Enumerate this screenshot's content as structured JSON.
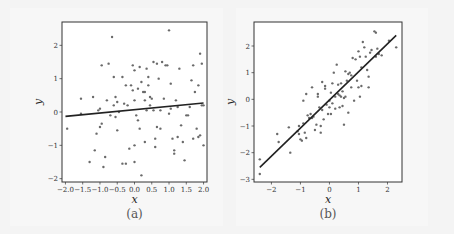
{
  "chart_data": [
    {
      "type": "scatter",
      "caption": "(a)",
      "xlabel": "x",
      "ylabel": "y",
      "xlim": [
        -2.1,
        2.1
      ],
      "ylim": [
        -2.1,
        2.7
      ],
      "xticks": [
        "-2.0",
        "-1.5",
        "-1.0",
        "-0.5",
        "0.0",
        "0.5",
        "1.0",
        "1.5",
        "2.0"
      ],
      "xtick_values": [
        -2.0,
        -1.5,
        -1.0,
        -0.5,
        0.0,
        0.5,
        1.0,
        1.5,
        2.0
      ],
      "yticks": [
        "-2",
        "-1",
        "0",
        "1",
        "2"
      ],
      "ytick_values": [
        -2,
        -1,
        0,
        1,
        2
      ],
      "grid": false,
      "fit_line": {
        "x": [
          -2.0,
          2.0
        ],
        "y": [
          -0.13,
          0.27
        ]
      },
      "points": [
        [
          -1.95,
          -0.5
        ],
        [
          -1.55,
          0.4
        ],
        [
          -1.55,
          -0.05
        ],
        [
          -1.2,
          0.45
        ],
        [
          -1.15,
          -1.15
        ],
        [
          -1.1,
          -0.65
        ],
        [
          -1.05,
          0.05
        ],
        [
          -1.0,
          0.1
        ],
        [
          -0.95,
          1.4
        ],
        [
          -1.0,
          -0.45
        ],
        [
          -0.95,
          -0.35
        ],
        [
          -0.9,
          -1.65
        ],
        [
          -0.85,
          -1.35
        ],
        [
          -0.75,
          1.45
        ],
        [
          -0.7,
          -0.1
        ],
        [
          -0.65,
          2.25
        ],
        [
          -0.6,
          1.05
        ],
        [
          -0.55,
          0.45
        ],
        [
          -0.55,
          -0.15
        ],
        [
          -0.5,
          0.3
        ],
        [
          -0.5,
          -0.55
        ],
        [
          -0.45,
          0.0
        ],
        [
          -0.35,
          1.05
        ],
        [
          -0.35,
          -1.55
        ],
        [
          -0.3,
          0.25
        ],
        [
          -0.25,
          -1.55
        ],
        [
          -0.2,
          0.2
        ],
        [
          -0.15,
          -1.1
        ],
        [
          -0.1,
          0.8
        ],
        [
          -0.05,
          0.65
        ],
        [
          -0.05,
          1.4
        ],
        [
          0.0,
          1.25
        ],
        [
          0.0,
          0.35
        ],
        [
          0.0,
          -1.0
        ],
        [
          0.0,
          -1.5
        ],
        [
          0.05,
          -0.1
        ],
        [
          0.1,
          0.7
        ],
        [
          0.1,
          -0.25
        ],
        [
          0.15,
          -0.5
        ],
        [
          0.2,
          0.9
        ],
        [
          0.2,
          -1.9
        ],
        [
          0.25,
          0.6
        ],
        [
          0.3,
          0.35
        ],
        [
          0.3,
          0.6
        ],
        [
          0.3,
          -0.9
        ],
        [
          0.35,
          1.3
        ],
        [
          0.35,
          0.05
        ],
        [
          0.4,
          1.05
        ],
        [
          0.4,
          0.8
        ],
        [
          0.45,
          0.45
        ],
        [
          0.5,
          0.4
        ],
        [
          0.55,
          1.5
        ],
        [
          0.55,
          0.05
        ],
        [
          0.6,
          -0.8
        ],
        [
          0.6,
          -1.05
        ],
        [
          0.65,
          -0.45
        ],
        [
          0.7,
          1.0
        ],
        [
          0.75,
          0.05
        ],
        [
          0.8,
          1.5
        ],
        [
          0.85,
          0.4
        ],
        [
          0.9,
          1.4
        ],
        [
          0.95,
          1.4
        ],
        [
          1.0,
          2.45
        ],
        [
          1.0,
          -0.05
        ],
        [
          1.05,
          0.1
        ],
        [
          1.1,
          -0.8
        ],
        [
          1.15,
          -1.15
        ],
        [
          1.15,
          -1.25
        ],
        [
          1.2,
          0.35
        ],
        [
          1.25,
          -0.75
        ],
        [
          1.25,
          0.15
        ],
        [
          1.3,
          1.3
        ],
        [
          1.35,
          -0.4
        ],
        [
          1.4,
          -0.9
        ],
        [
          1.45,
          -1.45
        ],
        [
          1.5,
          -0.1
        ],
        [
          1.55,
          -0.1
        ],
        [
          1.6,
          0.15
        ],
        [
          1.65,
          0.95
        ],
        [
          1.7,
          1.4
        ],
        [
          1.7,
          -0.8
        ],
        [
          1.75,
          0.6
        ],
        [
          1.8,
          -0.5
        ],
        [
          1.85,
          0.8
        ],
        [
          1.85,
          -0.75
        ],
        [
          1.9,
          -0.7
        ],
        [
          1.9,
          1.75
        ],
        [
          1.95,
          1.45
        ],
        [
          1.95,
          0.2
        ],
        [
          2.0,
          -1.0
        ],
        [
          2.0,
          0.2
        ],
        [
          -1.3,
          -1.5
        ],
        [
          -0.8,
          0.35
        ],
        [
          -0.25,
          0.8
        ],
        [
          0.45,
          0.2
        ],
        [
          0.75,
          -0.5
        ],
        [
          1.05,
          0.85
        ],
        [
          -0.6,
          0.2
        ],
        [
          0.15,
          1.35
        ],
        [
          0.65,
          1.45
        ]
      ]
    },
    {
      "type": "scatter",
      "caption": "(b)",
      "xlabel": "x",
      "ylabel": "y",
      "xlim": [
        -2.6,
        2.5
      ],
      "ylim": [
        -3.1,
        2.9
      ],
      "xticks": [
        "-2",
        "-1",
        "0",
        "1",
        "2"
      ],
      "xtick_values": [
        -2,
        -1,
        0,
        1,
        2
      ],
      "yticks": [
        "-3",
        "-2",
        "-1",
        "0",
        "1",
        "2"
      ],
      "ytick_values": [
        -3,
        -2,
        -1,
        0,
        1,
        2
      ],
      "grid": false,
      "fit_line": {
        "x": [
          -2.4,
          2.3
        ],
        "y": [
          -2.55,
          2.4
        ]
      },
      "points": [
        [
          -2.4,
          -2.25
        ],
        [
          -2.4,
          -2.8
        ],
        [
          -1.8,
          -1.3
        ],
        [
          -1.75,
          -1.6
        ],
        [
          -1.4,
          -1.05
        ],
        [
          -1.35,
          -2.0
        ],
        [
          -1.1,
          -1.2
        ],
        [
          -1.05,
          -1.0
        ],
        [
          -1.0,
          -1.5
        ],
        [
          -0.95,
          -1.55
        ],
        [
          -0.9,
          -0.9
        ],
        [
          -0.9,
          -0.05
        ],
        [
          -0.85,
          -1.25
        ],
        [
          -0.8,
          -1.45
        ],
        [
          -0.8,
          0.2
        ],
        [
          -0.75,
          -0.6
        ],
        [
          -0.7,
          -0.7
        ],
        [
          -0.65,
          -0.55
        ],
        [
          -0.6,
          0.45
        ],
        [
          -0.55,
          -0.65
        ],
        [
          -0.5,
          -1.15
        ],
        [
          -0.45,
          -0.95
        ],
        [
          -0.4,
          0.2
        ],
        [
          -0.4,
          0.1
        ],
        [
          -0.35,
          -0.3
        ],
        [
          -0.3,
          -1.0
        ],
        [
          -0.3,
          -1.25
        ],
        [
          -0.25,
          0.65
        ],
        [
          -0.2,
          -0.75
        ],
        [
          -0.15,
          0.5
        ],
        [
          -0.15,
          0.4
        ],
        [
          -0.1,
          -0.2
        ],
        [
          -0.05,
          -0.55
        ],
        [
          0.0,
          -0.3
        ],
        [
          0.0,
          -0.05
        ],
        [
          0.05,
          -0.55
        ],
        [
          0.1,
          0.6
        ],
        [
          0.1,
          -0.15
        ],
        [
          0.15,
          1.0
        ],
        [
          0.2,
          -0.35
        ],
        [
          0.2,
          0.1
        ],
        [
          0.25,
          1.3
        ],
        [
          0.3,
          0.2
        ],
        [
          0.3,
          0.55
        ],
        [
          0.35,
          0.15
        ],
        [
          0.35,
          -0.3
        ],
        [
          0.4,
          0.6
        ],
        [
          0.4,
          0.1
        ],
        [
          0.45,
          -0.25
        ],
        [
          0.5,
          0.05
        ],
        [
          0.5,
          -0.95
        ],
        [
          0.55,
          0.1
        ],
        [
          0.55,
          1.05
        ],
        [
          0.6,
          0.7
        ],
        [
          0.65,
          0.95
        ],
        [
          0.65,
          -0.5
        ],
        [
          0.7,
          1.0
        ],
        [
          0.75,
          0.45
        ],
        [
          0.8,
          1.55
        ],
        [
          0.85,
          -0.05
        ],
        [
          0.9,
          1.5
        ],
        [
          0.95,
          0.7
        ],
        [
          1.0,
          1.8
        ],
        [
          1.0,
          0.45
        ],
        [
          1.05,
          1.6
        ],
        [
          1.05,
          0.1
        ],
        [
          1.1,
          1.2
        ],
        [
          1.1,
          0.5
        ],
        [
          1.15,
          2.15
        ],
        [
          1.2,
          1.95
        ],
        [
          1.25,
          1.6
        ],
        [
          1.3,
          1.1
        ],
        [
          1.35,
          0.85
        ],
        [
          1.35,
          0.45
        ],
        [
          1.4,
          1.75
        ],
        [
          1.55,
          2.55
        ],
        [
          1.6,
          2.5
        ],
        [
          1.6,
          1.6
        ],
        [
          1.65,
          1.9
        ],
        [
          1.7,
          1.7
        ],
        [
          1.8,
          1.65
        ],
        [
          2.05,
          2.2
        ],
        [
          2.3,
          1.95
        ],
        [
          -1.05,
          -1.3
        ],
        [
          -0.6,
          -0.7
        ],
        [
          0.45,
          0.3
        ],
        [
          0.75,
          0.9
        ],
        [
          1.45,
          1.85
        ],
        [
          -0.25,
          -0.4
        ],
        [
          0.05,
          0.25
        ]
      ]
    }
  ]
}
